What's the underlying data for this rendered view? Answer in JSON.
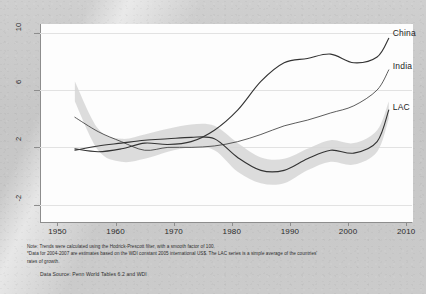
{
  "chart_data": {
    "type": "line",
    "title": "",
    "subtitle": "",
    "xlabel": "",
    "ylabel": "",
    "xlim": [
      1947,
      2011
    ],
    "ylim": [
      -3.2,
      10.6
    ],
    "xticks": [
      "1950",
      "1960",
      "1970",
      "1980",
      "1990",
      "2000",
      "2010"
    ],
    "xtick_values": [
      1950,
      1960,
      1970,
      1980,
      1990,
      2000,
      2010
    ],
    "yticks": [
      "10",
      "6",
      "2",
      "-2"
    ],
    "ytick_values": [
      10,
      6,
      2,
      -2
    ],
    "grid": "horizontal",
    "legend_position": "inline-right-end-of-line",
    "band": {
      "name": "LAC range",
      "color": "#d6d6d6",
      "x": [
        1953,
        1957,
        1961,
        1965,
        1969,
        1973,
        1977,
        1981,
        1985,
        1989,
        1993,
        1997,
        2001,
        2005,
        2007
      ],
      "upper": [
        6.6,
        3.3,
        2.6,
        2.9,
        3.3,
        3.6,
        3.5,
        2.3,
        1.3,
        1.2,
        1.9,
        2.5,
        2.3,
        3.2,
        5.2
      ],
      "lower": [
        5.2,
        1.8,
        1.0,
        1.2,
        1.7,
        2.0,
        1.8,
        0.3,
        -0.5,
        -0.5,
        0.4,
        1.0,
        0.8,
        1.7,
        4.0
      ]
    },
    "series": [
      {
        "name": "China",
        "label": "China",
        "color": "#333333",
        "x": [
          1953,
          1957,
          1961,
          1965,
          1969,
          1973,
          1977,
          1981,
          1985,
          1989,
          1993,
          1997,
          2001,
          2005,
          2007
        ],
        "values": [
          1.9,
          1.7,
          1.9,
          2.3,
          2.2,
          2.4,
          3.2,
          4.6,
          6.6,
          7.9,
          8.2,
          8.5,
          7.9,
          8.3,
          9.6
        ]
      },
      {
        "name": "India",
        "label": "India",
        "color": "#333333",
        "x": [
          1953,
          1957,
          1961,
          1965,
          1969,
          1973,
          1977,
          1981,
          1985,
          1989,
          1993,
          1997,
          2001,
          2005,
          2007
        ],
        "values": [
          4.1,
          3.1,
          2.4,
          1.8,
          2.0,
          2.0,
          2.1,
          2.4,
          2.9,
          3.5,
          3.9,
          4.4,
          4.9,
          6.0,
          7.4
        ]
      },
      {
        "name": "LAC",
        "label": "LAC",
        "color": "#333333",
        "x": [
          1953,
          1957,
          1961,
          1965,
          1969,
          1973,
          1977,
          1981,
          1985,
          1989,
          1993,
          1997,
          2001,
          2005,
          2007
        ],
        "values": [
          1.8,
          2.1,
          2.3,
          2.5,
          2.6,
          2.7,
          2.6,
          1.3,
          0.4,
          0.4,
          1.2,
          1.8,
          1.6,
          2.4,
          4.6
        ]
      }
    ]
  },
  "labels": {
    "china": "China",
    "india": "India",
    "lac": "LAC"
  },
  "notes": {
    "line1": "Note: Trends were calculated using the Hodrick-Prescott filter, with a smooth factor of 100.",
    "line2": "*Data for 2004-2007 are estimates based on the WDI  constant 2005 international US$. The LAC series is a simple average of the countries'",
    "line3": "rates of growth.",
    "source": "Data Source: Penn World Tables 6.2 and WDI"
  }
}
